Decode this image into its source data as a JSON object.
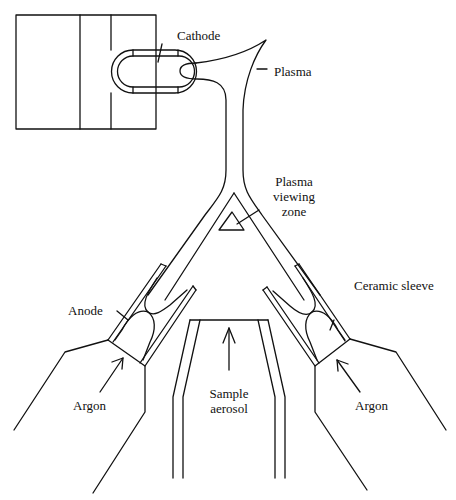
{
  "diagram": {
    "type": "schematic",
    "colors": {
      "line": "#111111",
      "background": "#ffffff"
    },
    "labels": {
      "cathode": "Cathode",
      "plasma": "Plasma",
      "viewing_zone_line1": "Plasma",
      "viewing_zone_line2": "viewing",
      "viewing_zone_line3": "zone",
      "anode": "Anode",
      "ceramic_sleeve": "Ceramic sleeve",
      "argon_left": "Argon",
      "argon_right": "Argon",
      "sample_line1": "Sample",
      "sample_line2": "aerosol"
    },
    "components": [
      "cathode-block",
      "cathode",
      "plasma-jet",
      "plasma-viewing-zone",
      "left-anode-assembly",
      "right-anode-assembly",
      "sample-aerosol-tube"
    ]
  }
}
